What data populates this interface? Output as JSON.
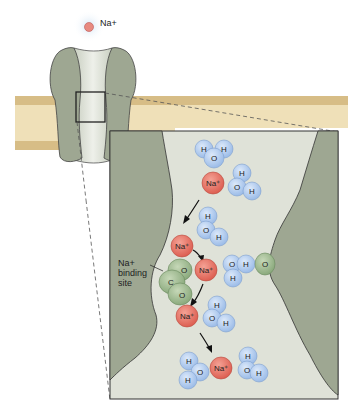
{
  "diagram": {
    "type": "sodium ion channel",
    "top_ion_label": "Na+",
    "binding_site_label_line1": "Na+",
    "binding_site_label_line2": "binding",
    "binding_site_label_line3": "site",
    "ion_label": "Na+",
    "water": {
      "h": "H",
      "o": "O"
    },
    "carboxyl": {
      "c": "C",
      "o": "O"
    },
    "opposite_residue_label": "O",
    "colors": {
      "protein": "#9ea792",
      "pore": "#dfe2d8",
      "membrane_outer": "#d8c08c",
      "membrane_inner": "#efe0b8",
      "sodium": "#e8776a",
      "water": "#a9c6ec",
      "binding_site": "#9fba8e",
      "background": "#ffffff"
    }
  }
}
